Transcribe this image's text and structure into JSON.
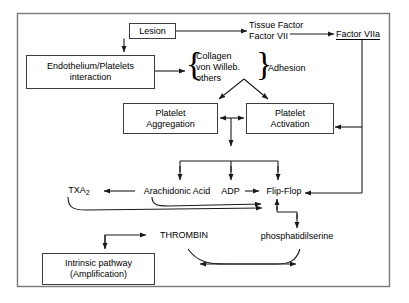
{
  "diagram": {
    "frame": {
      "stroke": "#6b6b6b"
    },
    "line_color": "#1a1a1a",
    "nodes": {
      "lesion": {
        "label": "Lesion",
        "shape": "box"
      },
      "tissue_factor": {
        "label": "Tissue Factor\nFactor VII",
        "shape": "text"
      },
      "factor_viia": {
        "label": "Factor VIIa",
        "shape": "text-underlined"
      },
      "endothelium": {
        "label": "Endothelium/Platelets\ninteraction",
        "shape": "box"
      },
      "collagen_group": {
        "label": "Collagen\nvon Willeb.\nothers",
        "shape": "braced-text"
      },
      "adhesion": {
        "label": "Adhesion",
        "shape": "text"
      },
      "platelet_aggregation": {
        "label": "Platelet\nAggregation",
        "shape": "box"
      },
      "platelet_activation": {
        "label": "Platelet\nActivation",
        "shape": "box"
      },
      "txa2": {
        "label": "TXA",
        "sub": "2",
        "shape": "text"
      },
      "arachidonic_acid": {
        "label": "Arachidonic Acid",
        "shape": "text"
      },
      "adp": {
        "label": "ADP",
        "shape": "text"
      },
      "flip_flop": {
        "label": "Flip-Flop",
        "shape": "text"
      },
      "phosphatidilserine": {
        "label": "phosphatidilserine",
        "shape": "text"
      },
      "thrombin": {
        "label": "THROMBIN",
        "shape": "text"
      },
      "intrinsic_pathway": {
        "label": "Intrinsic pathway\n(Amplification)",
        "shape": "box"
      }
    },
    "edges": [
      {
        "from": "lesion",
        "to": "tissue_factor",
        "style": "arrow"
      },
      {
        "from": "lesion",
        "to": "endothelium",
        "style": "arrow"
      },
      {
        "from": "tissue_factor",
        "to": "factor_viia",
        "style": "arrow"
      },
      {
        "from": "endothelium",
        "to": "collagen_group",
        "style": "arrow"
      },
      {
        "from": "adhesion",
        "to": "platelet_aggregation",
        "style": "arrow"
      },
      {
        "from": "adhesion",
        "to": "platelet_activation",
        "style": "arrow"
      },
      {
        "from": "platelet_activation",
        "to": "platelet_aggregation",
        "style": "arrow"
      },
      {
        "from": "platelet_aggregation",
        "to": "platelet_activation",
        "style": "arrow"
      },
      {
        "from": "factor_viia",
        "to": "platelet_activation",
        "style": "arrow"
      },
      {
        "from": "factor_viia",
        "to": "flip_flop",
        "style": "arrow"
      },
      {
        "from": "platelet_activation",
        "to": "arachidonic_acid",
        "style": "arrow"
      },
      {
        "from": "platelet_activation",
        "to": "adp",
        "style": "arrow"
      },
      {
        "from": "platelet_activation",
        "to": "flip_flop",
        "style": "arrow"
      },
      {
        "from": "arachidonic_acid",
        "to": "txa2",
        "style": "arrow"
      },
      {
        "from": "adp",
        "to": "flip_flop",
        "style": "arrow"
      },
      {
        "from": "txa2",
        "to": "flip_flop",
        "style": "curve-arrow"
      },
      {
        "from": "arachidonic_acid",
        "to": "flip_flop",
        "style": "curve-arrow"
      },
      {
        "from": "flip_flop",
        "to": "phosphatidilserine",
        "style": "arrow"
      },
      {
        "from": "phosphatidilserine",
        "to": "flip_flop",
        "style": "arrow"
      },
      {
        "from": "thrombin",
        "to": "intrinsic_pathway",
        "style": "arrow"
      },
      {
        "from": "phosphatidilserine",
        "to": "thrombin",
        "style": "curve-arrow"
      },
      {
        "from": "thrombin",
        "to": "phosphatidilserine",
        "style": "curve-arrow"
      }
    ]
  }
}
